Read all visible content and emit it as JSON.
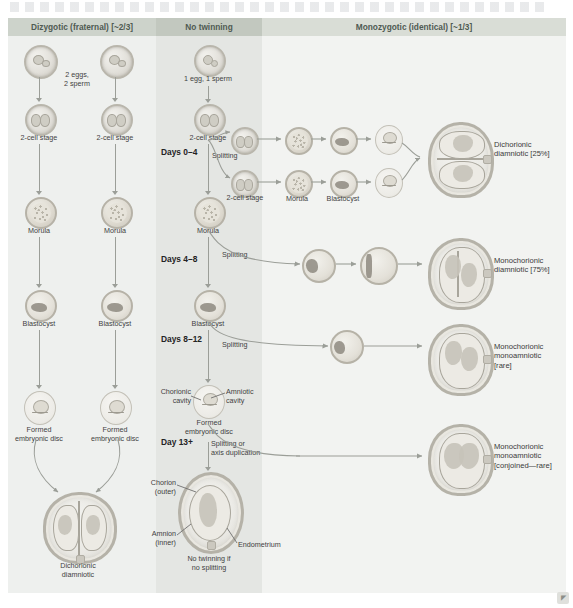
{
  "columns": {
    "dizygotic": {
      "header": "Dizygotic (fraternal) [~2/3]"
    },
    "no_twinning": {
      "header": "No twinning"
    },
    "monozygotic": {
      "header": "Monozygotic (identical) [~1/3]"
    }
  },
  "dizygotic": {
    "gametes_note": "2 eggs,\n2 sperm",
    "left_chain": [
      "2-cell stage",
      "Morula",
      "Blastocyst",
      "Formed\nembryonic disc"
    ],
    "right_chain": [
      "2-cell stage",
      "Morula",
      "Blastocyst",
      "Formed\nembryonic disc"
    ],
    "outcome": "Dichorionic\ndiamniotic"
  },
  "no_twinning": {
    "gamete_note": "1 egg, 1 sperm",
    "chain": [
      "2-cell stage",
      "Morula",
      "Blastocyst",
      "Formed\nembryonic disc"
    ],
    "split_2cell_label": "2-cell stage",
    "timeline": [
      {
        "days": "Days 0–4",
        "split_label": "Splitting"
      },
      {
        "days": "Days 4–8",
        "split_label": "Splitting"
      },
      {
        "days": "Days 8–12",
        "split_label": "Splitting"
      },
      {
        "days": "Day 13+",
        "split_label": "Splitting or\naxis duplication"
      }
    ],
    "disc_callouts": {
      "chorionic_cavity": "Chorionic\ncavity",
      "amniotic_cavity": "Amniotic\ncavity"
    },
    "fetus_callouts": {
      "chorion": "Chorion\n(outer)",
      "amnion": "Amnion\n(inner)",
      "endometrium": "Endometrium"
    },
    "footer": "No twinning if\nno splitting"
  },
  "monozygotic": {
    "row1_labels": [
      "Morula",
      "Blastocyst"
    ],
    "outcomes": [
      "Dichorionic\ndiamniotic [25%]",
      "Monochorionic\ndiamniotic [75%]",
      "Monochorionic\nmonoamniotic\n[rare]",
      "Monochorionic\nmonoamniotic\n[conjoined—rare]"
    ]
  },
  "corner_mark": "◤",
  "colors": {
    "band_dizygotic": "#cdd3cb",
    "band_no_twinning": "#c2c8bf",
    "band_monozygotic": "#d9ddd6",
    "panel_dizygotic": "#eef0ee",
    "panel_no_twinning": "#e4e6e3",
    "panel_monozygotic": "#f2f3f1",
    "arrow": "#9b9e98",
    "text": "#3d3d3d",
    "header_text": "#4f5a52"
  }
}
